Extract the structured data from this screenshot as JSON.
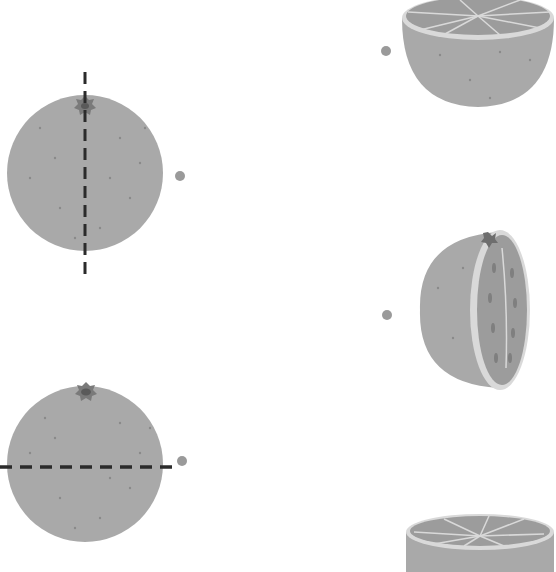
{
  "worksheet": {
    "type": "matching-exercise",
    "instructions": "",
    "colors": {
      "background": "#ffffff",
      "peel": "#a9a9a9",
      "peel_dots": "#8a8a8a",
      "flesh": "#9c9c9c",
      "pith": "#d9d9d9",
      "cut_line": "#2b2b2b",
      "stem": "#6e6e6e",
      "match_dot": "#9a9a9a"
    },
    "left_items": [
      {
        "id": "whole-orange-vertical-cut",
        "cut": "vertical",
        "dot": {
          "x": 180,
          "y": 176
        }
      },
      {
        "id": "whole-orange-horizontal-cut",
        "cut": "horizontal",
        "dot": {
          "x": 182,
          "y": 461
        }
      }
    ],
    "right_items": [
      {
        "id": "half-orange-top-open-bowl",
        "dot": {
          "x": 386,
          "y": 51
        }
      },
      {
        "id": "half-orange-side-cut",
        "dot": {
          "x": 387,
          "y": 315
        }
      },
      {
        "id": "half-orange-top-cut-bottom",
        "dot": {
          "x": null,
          "y": null
        }
      }
    ]
  }
}
